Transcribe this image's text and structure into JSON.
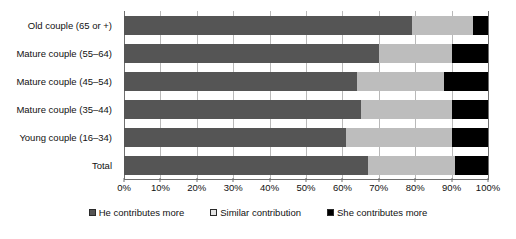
{
  "chart_data": {
    "type": "bar",
    "orientation": "horizontal",
    "stacked": true,
    "stack_mode": "percent",
    "title": "",
    "subtitle": "",
    "xlabel": "",
    "ylabel": "",
    "xlim": [
      0,
      100
    ],
    "grid": true,
    "legend_position": "bottom",
    "categories": [
      "Old couple (65 or +)",
      "Mature couple (55–64)",
      "Mature couple (45–54)",
      "Mature couple (35–44)",
      "Young couple (16–34)",
      "Total"
    ],
    "tick_labels": [
      "0%",
      "10%",
      "20%",
      "30%",
      "40%",
      "50%",
      "60%",
      "70%",
      "80%",
      "90%",
      "100%"
    ],
    "tick_values": [
      0,
      10,
      20,
      30,
      40,
      50,
      60,
      70,
      80,
      90,
      100
    ],
    "series": [
      {
        "name": "He contributes more",
        "color": "#555555",
        "values": [
          79,
          70,
          64,
          65,
          61,
          67
        ]
      },
      {
        "name": "Similar contribution",
        "color": "#bdbdbd",
        "values": [
          17,
          20,
          24,
          25,
          29,
          24
        ]
      },
      {
        "name": "She contributes more",
        "color": "#000000",
        "values": [
          4,
          10,
          12,
          10,
          10,
          9
        ]
      }
    ]
  },
  "colors": {
    "he_contributes_more": "#555555",
    "similar_contribution": "#bdbdbd",
    "she_contributes_more": "#000000",
    "gridline": "#b9b9b9",
    "axis": "#6f6f6f",
    "background": "#ffffff",
    "text": "#111111"
  }
}
